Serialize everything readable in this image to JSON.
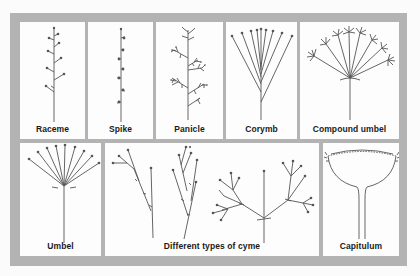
{
  "diagram": {
    "panels": [
      {
        "id": "raceme",
        "label": "Raceme"
      },
      {
        "id": "spike",
        "label": "Spike"
      },
      {
        "id": "panicle",
        "label": "Panicle"
      },
      {
        "id": "corymb",
        "label": "Corymb"
      },
      {
        "id": "compound-umbel",
        "label": "Compound umbel"
      },
      {
        "id": "umbel",
        "label": "Umbel"
      },
      {
        "id": "cyme",
        "label": "Different types of cyme"
      },
      {
        "id": "capitulum",
        "label": "Capitulum"
      }
    ],
    "colors": {
      "frame": "#b3b3b3",
      "panel": "#fdfdfd",
      "stroke": "#555555",
      "text": "#1a1a1a"
    }
  }
}
